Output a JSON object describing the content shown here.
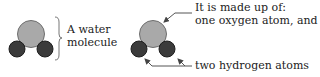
{
  "diagram": {
    "colors": {
      "oxygen_fill": "#a9a9a9",
      "oxygen_stroke": "#6e6e6e",
      "hydrogen_fill": "#3b3b3b",
      "hydrogen_stroke": "#1e1e1e",
      "line": "#555555",
      "text": "#222222"
    },
    "left_molecule": {
      "label_line1": "A water",
      "label_line2": "molecule"
    },
    "right_molecule": {
      "label_line1": "It is made up of:",
      "label_line2": "one oxygen atom, and",
      "label_line3": "two hydrogen atoms"
    }
  }
}
